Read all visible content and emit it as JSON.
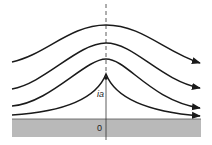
{
  "diagram": {
    "labels": {
      "point_label": "ia",
      "origin_label": "0"
    },
    "colors": {
      "line": "#1a1a1a",
      "ground": "#b9b9b9",
      "background": "#ffffff"
    },
    "streamlines": [
      {
        "name": "streamline-1",
        "path": "M12,62 C45,55 70,25 106,25 C142,25 165,52 200,63"
      },
      {
        "name": "streamline-2",
        "path": "M12,89 C45,83 78,43 106,43 C134,43 160,80 200,88"
      },
      {
        "name": "streamline-3",
        "path": "M12,106 C50,103 85,59 106,59 C127,59 150,100 200,108"
      },
      {
        "name": "streamline-4",
        "path": "M12,115 C60,112 96,100 106,74 C116,100 150,112 200,116"
      }
    ]
  }
}
